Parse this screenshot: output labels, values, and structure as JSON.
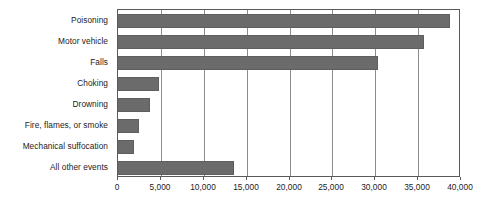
{
  "chart_data": {
    "type": "bar",
    "orientation": "horizontal",
    "title": "",
    "subtitle": "",
    "xlabel": "",
    "ylabel": "",
    "categories": [
      "Poisoning",
      "Motor vehicle",
      "Falls",
      "Choking",
      "Drowning",
      "Fire, flames, or smoke",
      "Mechanical suffocation",
      "All other events"
    ],
    "values": [
      38700,
      35700,
      30300,
      4800,
      3700,
      2400,
      1900,
      13500
    ],
    "xlim": [
      0,
      40000
    ],
    "xticks": [
      0,
      5000,
      10000,
      15000,
      20000,
      25000,
      30000,
      35000,
      40000
    ],
    "xtick_labels": [
      "0",
      "5,000",
      "10,000",
      "15,000",
      "20,000",
      "25,000",
      "30,000",
      "35,000",
      "40,000"
    ],
    "grid": "vertical",
    "legend": null,
    "annotations": [],
    "colors": {
      "bar_fill": "#6b6b6b",
      "bar_stroke": "#5e5e5e",
      "gridline": "#8d8d8d",
      "axis": "#5a5a5a",
      "text": "#1c1c1c",
      "background": "#ffffff"
    }
  }
}
